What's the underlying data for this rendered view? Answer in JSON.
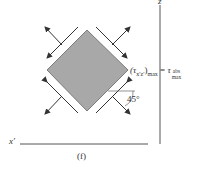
{
  "figure": {
    "panel_label": "(f)",
    "axes": {
      "vertical": "z",
      "horizontal": "x′"
    },
    "element": {
      "shape": "square rotated 45 degrees",
      "fill": "#a8a8a8",
      "stroke": "#555555"
    },
    "angle_label": "45°",
    "equation": {
      "lhs_symbol": "(τ",
      "lhs_sub": "x′z′",
      "lhs_close": ")",
      "lhs_suffix": "max",
      "equals": " = ",
      "rhs_symbol": "τ",
      "rhs_sub_top": "abs",
      "rhs_sub_bottom": "max"
    },
    "colors": {
      "lines": "#444444",
      "fill": "#a8a8a8",
      "text": "#333333"
    }
  }
}
